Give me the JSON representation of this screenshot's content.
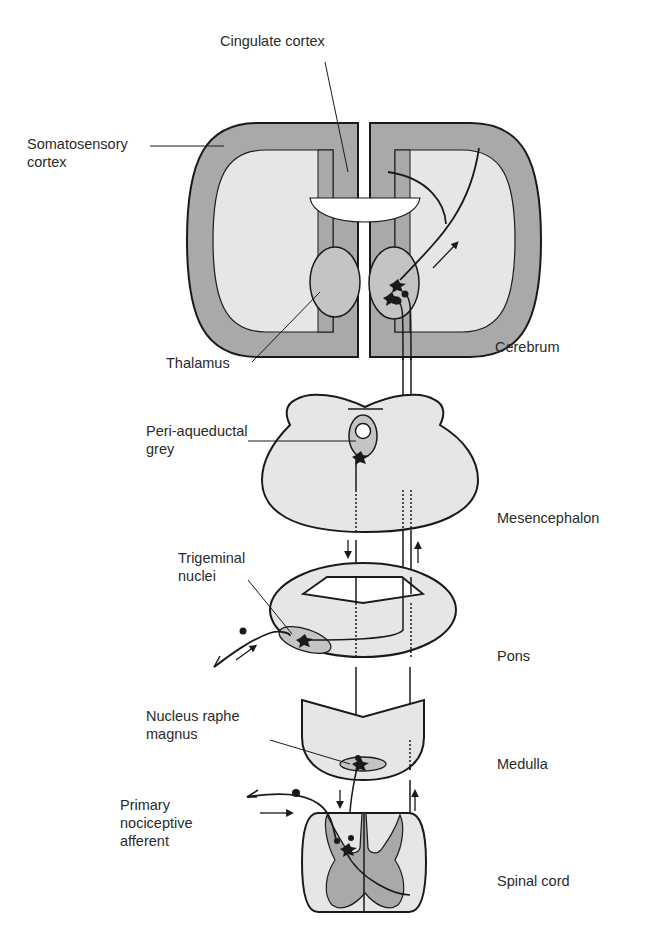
{
  "diagram": {
    "colors": {
      "outline": "#1a1a1a",
      "dark_fill": "#a9a9a9",
      "light_fill": "#e6e6e6",
      "background": "#ffffff"
    },
    "left_labels": {
      "cingulate_cortex": "Cingulate cortex",
      "somatosensory_cortex_line1": "Somatosensory",
      "somatosensory_cortex_line2": "cortex",
      "thalamus": "Thalamus",
      "pag_line1": "Peri-aqueductal",
      "pag_line2": "grey",
      "trigeminal_line1": "Trigeminal",
      "trigeminal_line2": "nuclei",
      "nrm_line1": "Nucleus raphe",
      "nrm_line2": "magnus",
      "afferent_line1": "Primary",
      "afferent_line2": "nociceptive",
      "afferent_line3": "afferent"
    },
    "level_labels": {
      "cerebrum": "Cerebrum",
      "mesencephalon": "Mesencephalon",
      "pons": "Pons",
      "medulla": "Medulla",
      "spinal_cord": "Spinal cord"
    },
    "structures": [
      "cerebrum",
      "mesencephalon",
      "pons",
      "medulla",
      "spinal-cord"
    ]
  }
}
